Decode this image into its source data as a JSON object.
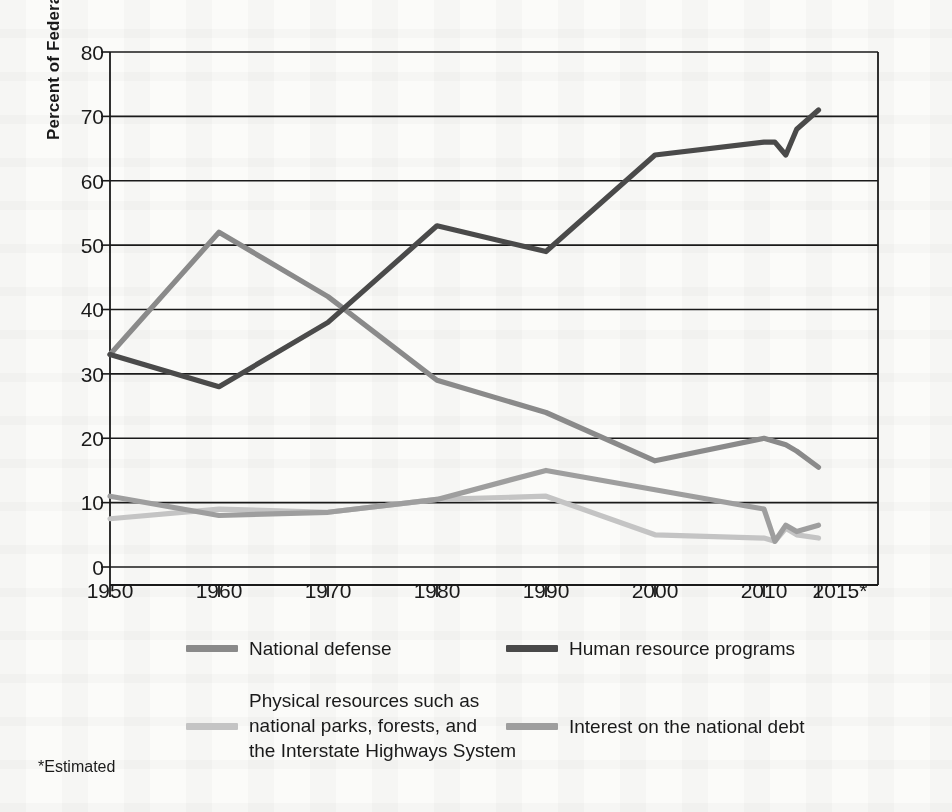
{
  "chart_data": {
    "type": "line",
    "title": "",
    "xlabel": "",
    "ylabel": "Percent of Federal Budget",
    "xlim": [
      1950,
      2015
    ],
    "ylim": [
      0,
      80
    ],
    "yticks": [
      0,
      10,
      20,
      30,
      40,
      50,
      60,
      70,
      80
    ],
    "xticks": [
      1950,
      1960,
      1970,
      1980,
      1990,
      2000,
      2010,
      2015
    ],
    "xtick_labels": [
      "1950",
      "1960",
      "1970",
      "1980",
      "1990",
      "2000",
      "2010",
      "2015*"
    ],
    "grid": "horizontal",
    "legend_position": "below",
    "footnote": "*Estimated",
    "series": [
      {
        "name": "National defense",
        "color": "#8a8a8a",
        "x": [
          1950,
          1960,
          1970,
          1980,
          1990,
          2000,
          2010,
          2011,
          2012,
          2013,
          2015
        ],
        "values": [
          33,
          52,
          42,
          29,
          24,
          16.5,
          20,
          19.5,
          19,
          18,
          15.5
        ]
      },
      {
        "name": "Human resource programs",
        "color": "#4a4a4a",
        "x": [
          1950,
          1960,
          1970,
          1980,
          1990,
          2000,
          2010,
          2011,
          2012,
          2013,
          2015
        ],
        "values": [
          33,
          28,
          38,
          53,
          49,
          64,
          66,
          66,
          64,
          68,
          71
        ]
      },
      {
        "name": "Physical resources such as\nnational parks, forests, and\nthe Interstate Highways System",
        "color": "#c4c4c4",
        "x": [
          1950,
          1960,
          1970,
          1980,
          1990,
          2000,
          2010,
          2011,
          2012,
          2013,
          2015
        ],
        "values": [
          7.5,
          9,
          8.5,
          10.5,
          11,
          5,
          4.5,
          4,
          6,
          5,
          4.5
        ]
      },
      {
        "name": "Interest on the national debt",
        "color": "#9e9e9e",
        "x": [
          1950,
          1960,
          1970,
          1980,
          1990,
          2000,
          2010,
          2011,
          2012,
          2013,
          2015
        ],
        "values": [
          11,
          8,
          8.5,
          10.5,
          15,
          12,
          9,
          4,
          6.5,
          5.5,
          6.5
        ]
      }
    ]
  },
  "axis": {
    "ylabel": "Percent of Federal Budget",
    "ytick_0": "0",
    "ytick_10": "10",
    "ytick_20": "20",
    "ytick_30": "30",
    "ytick_40": "40",
    "ytick_50": "50",
    "ytick_60": "60",
    "ytick_70": "70",
    "ytick_80": "80",
    "xtick_1950": "1950",
    "xtick_1960": "1960",
    "xtick_1970": "1970",
    "xtick_1980": "1980",
    "xtick_1990": "1990",
    "xtick_2000": "2000",
    "xtick_2010": "2010",
    "xtick_2015": "2015*"
  },
  "legend": {
    "items": [
      {
        "label": "National defense",
        "color": "#8a8a8a"
      },
      {
        "label": "Human resource programs",
        "color": "#4a4a4a"
      },
      {
        "label": "Physical resources such as\nnational parks, forests, and\nthe Interstate Highways System",
        "color": "#c4c4c4"
      },
      {
        "label": "Interest on the national debt",
        "color": "#9e9e9e"
      }
    ]
  },
  "footnote": {
    "text": "*Estimated"
  },
  "colors": {
    "national_defense": "#8a8a8a",
    "human_resources": "#4a4a4a",
    "physical_resources": "#c4c4c4",
    "interest_debt": "#9e9e9e",
    "axis": "#1a1a1a",
    "page_background": "#fbfbf9"
  }
}
